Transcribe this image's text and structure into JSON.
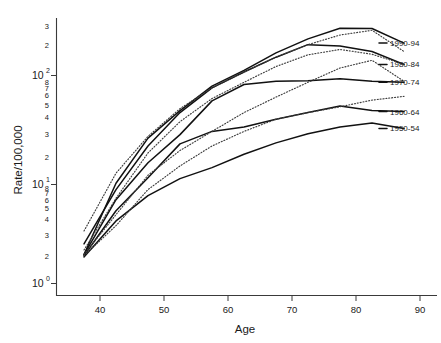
{
  "chart_data": {
    "type": "line",
    "title": "",
    "xlabel": "Age",
    "ylabel": "Rate/100,000",
    "yscale": "log",
    "xlim": [
      34,
      94
    ],
    "ylim": [
      1,
      400
    ],
    "grid": false,
    "legend_position": "right-of-axes-inline",
    "x_ticks": [
      40,
      50,
      60,
      70,
      80,
      90
    ],
    "x_tick_labels": [
      "40",
      "50",
      "60",
      "70",
      "80",
      "90"
    ],
    "y_major_ticks": [
      1,
      10,
      100
    ],
    "y_major_tick_labels": [
      "10^0",
      "10^1",
      "10^2"
    ],
    "y_minor_tick_labels_decade1": [
      "2",
      "3",
      "4",
      "5",
      "6",
      "7",
      "8"
    ],
    "y_minor_tick_labels_decade2": [
      "2",
      "3",
      "4",
      "5",
      "6",
      "7",
      "8"
    ],
    "y_minor_tick_labels_decade3": [
      "2",
      "3"
    ],
    "x": [
      37.5,
      42.5,
      47.5,
      52.5,
      57.5,
      62.5,
      67.5,
      72.5,
      77.5,
      82.5,
      87.5
    ],
    "series": [
      {
        "name": "1990-94",
        "style": "solid",
        "values": [
          1.9,
          9.2,
          25,
          46,
          79,
          112,
          165,
          225,
          285,
          283,
          205
        ]
      },
      {
        "name": "1980-84",
        "style": "solid",
        "values": [
          2.4,
          8.0,
          21,
          44,
          76,
          108,
          150,
          198,
          192,
          170,
          128
        ]
      },
      {
        "name": "1970-74",
        "style": "solid",
        "values": [
          1.9,
          6.4,
          14.5,
          27,
          57,
          82,
          88,
          89,
          93,
          88,
          86
        ]
      },
      {
        "name": "1960-64",
        "style": "solid",
        "values": [
          1.85,
          5.0,
          10.4,
          22,
          29,
          32,
          38,
          44,
          51,
          46,
          45
        ]
      },
      {
        "name": "1950-54",
        "style": "solid",
        "values": [
          1.8,
          4.0,
          7.0,
          10.2,
          13.0,
          17.5,
          22.5,
          27.5,
          32,
          35,
          31
        ]
      },
      {
        "name": "dotted-a",
        "style": "dotted",
        "values": [
          3.2,
          11.5,
          26,
          48,
          76,
          108,
          150,
          198,
          245,
          272,
          170
        ]
      },
      {
        "name": "dotted-b",
        "style": "dotted",
        "values": [
          2.1,
          6.6,
          18,
          36,
          60,
          86,
          122,
          158,
          178,
          160,
          128
        ]
      },
      {
        "name": "dotted-c",
        "style": "dotted",
        "values": [
          1.9,
          4.6,
          11.0,
          19,
          29,
          44,
          62,
          86,
          118,
          140,
          88
        ]
      },
      {
        "name": "dotted-d",
        "style": "dotted",
        "values": [
          1.85,
          3.6,
          8.0,
          13.5,
          21,
          29,
          38,
          44,
          50,
          58,
          63
        ]
      }
    ],
    "legend_entries": [
      {
        "label": "1990-94",
        "y_value": 205
      },
      {
        "label": "1980-84",
        "y_value": 128
      },
      {
        "label": "1970-74",
        "y_value": 86
      },
      {
        "label": "1960-64",
        "y_value": 45
      },
      {
        "label": "1950-54",
        "y_value": 31
      }
    ]
  },
  "labels": {
    "y_axis_title": "Rate/100,000",
    "x_axis_title": "Age",
    "x_tick_40": "40",
    "x_tick_50": "50",
    "x_tick_60": "60",
    "x_tick_70": "70",
    "x_tick_80": "80",
    "x_tick_90": "90",
    "y_base": "10",
    "y_exp_0": "0",
    "y_exp_1": "1",
    "y_exp_2": "2",
    "m2": "2",
    "m3": "3",
    "m4": "4",
    "m5": "5",
    "m6": "6",
    "m7": "7",
    "m8": "8"
  },
  "legend": {
    "items": [
      {
        "label": "1990-94"
      },
      {
        "label": "1980-84"
      },
      {
        "label": "1970-74"
      },
      {
        "label": "1960-64"
      },
      {
        "label": "1950-54"
      }
    ]
  },
  "colors": {
    "background": "#ffffff",
    "axis": "#3a3a3a",
    "solid_series": "#111111",
    "dotted_series": "#3d3d3d",
    "text": "#1a1a1a"
  }
}
